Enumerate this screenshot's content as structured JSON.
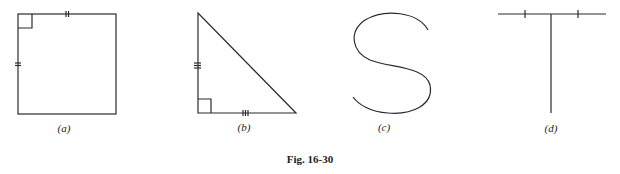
{
  "figure": {
    "caption": "Fig. 16-30",
    "panels": [
      {
        "id": "a",
        "label": "(a)",
        "shape": "square",
        "marks": [
          "right-angle top-left",
          "double tick top side",
          "double tick left side"
        ]
      },
      {
        "id": "b",
        "label": "(b)",
        "shape": "right-triangle",
        "marks": [
          "right-angle bottom-left",
          "triple tick left leg",
          "triple tick bottom leg"
        ]
      },
      {
        "id": "c",
        "label": "(c)",
        "shape": "s-curve",
        "marks": []
      },
      {
        "id": "d",
        "label": "(d)",
        "shape": "t-shape",
        "marks": [
          "single tick left half of top bar",
          "single tick right half of top bar"
        ]
      }
    ]
  },
  "colors": {
    "stroke": "#2a2a2a",
    "background": "#ffffff"
  }
}
